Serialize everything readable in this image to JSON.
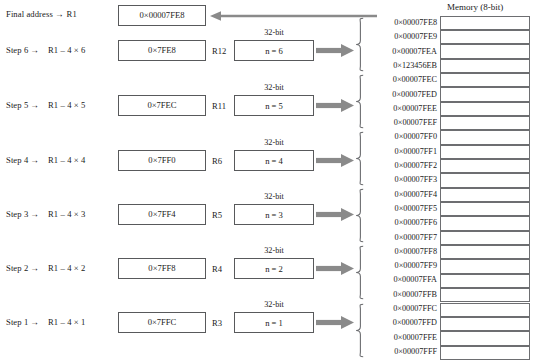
{
  "memory": {
    "header": "Memory (8-bit)",
    "cell_count": 24
  },
  "final_row": {
    "label": "Final address",
    "arrow": "→",
    "register": "R1",
    "value": "0×00007FE8"
  },
  "steps": [
    {
      "step_label": "Step 6",
      "arrow": "→",
      "expression": "R1 – 4 × 6",
      "address_value": "0×7FE8",
      "register": "R12",
      "bit_caption": "32-bit",
      "n_value": "n = 6"
    },
    {
      "step_label": "Step 5",
      "arrow": "→",
      "expression": "R1 – 4 × 5",
      "address_value": "0×7FEC",
      "register": "R11",
      "bit_caption": "32-bit",
      "n_value": "n = 5"
    },
    {
      "step_label": "Step 4",
      "arrow": "→",
      "expression": "R1 – 4 × 4",
      "address_value": "0×7FF0",
      "register": "R6",
      "bit_caption": "32-bit",
      "n_value": "n = 4"
    },
    {
      "step_label": "Step 3",
      "arrow": "→",
      "expression": "R1 – 4 × 3",
      "address_value": "0×7FF4",
      "register": "R5",
      "bit_caption": "32-bit",
      "n_value": "n = 3"
    },
    {
      "step_label": "Step 2",
      "arrow": "→",
      "expression": "R1 – 4 × 2",
      "address_value": "0×7FF8",
      "register": "R4",
      "bit_caption": "32-bit",
      "n_value": "n = 2"
    },
    {
      "step_label": "Step 1",
      "arrow": "→",
      "expression": "R1 – 4 × 1",
      "address_value": "0×7FFC",
      "register": "R3",
      "bit_caption": "32-bit",
      "n_value": "n = 1"
    }
  ],
  "addresses": [
    "0×00007FE8",
    "0×00007FE9",
    "0×00007FEA",
    "0×123456EB",
    "0×00007FEC",
    "0×00007FED",
    "0×00007FEE",
    "0×00007FEF",
    "0×00007FF0",
    "0×00007FF1",
    "0×00007FF2",
    "0×00007FF3",
    "0×00007FF4",
    "0×00007FF5",
    "0×00007FF6",
    "0×00007FF7",
    "0×00007FF8",
    "0×00007FF9",
    "0×00007FFA",
    "0×00007FFB",
    "0×00007FFC",
    "0×00007FFD",
    "0×00007FFE",
    "0×00007FFF"
  ],
  "colors": {
    "arrow": "#8a8a8a",
    "brace": "#6d6e71",
    "box_border": "#58595b",
    "cell_border": "#6d6e71",
    "text": "#1a1a1a",
    "background": "#ffffff"
  }
}
